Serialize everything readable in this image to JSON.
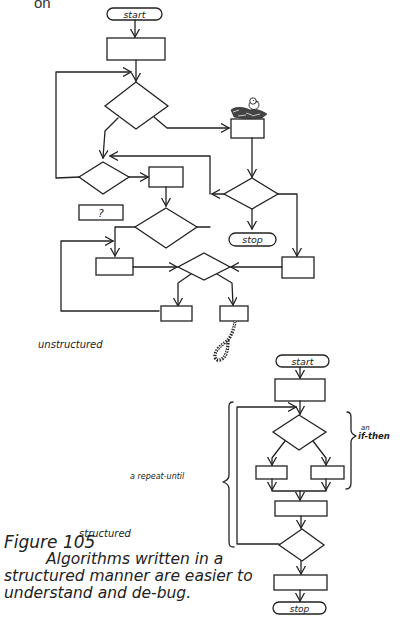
{
  "header": {
    "fragment": "on"
  },
  "unstructured": {
    "label": "unstructured",
    "start_label": "start",
    "stop_label": "stop",
    "question_box_label": "?",
    "decorations": [
      "bird-on-nest",
      "noose"
    ]
  },
  "structured": {
    "label": "structured",
    "start_label": "start",
    "stop_label": "stop",
    "if_then_prefix": "an",
    "if_then_label": "if-then",
    "repeat_until_label": "a repeat-until"
  },
  "caption": {
    "figure": "Figure 105",
    "line1": "Algorithms written in a",
    "line2": "structured manner are easier to",
    "line3": "understand and de-bug."
  },
  "colors": {
    "ink": "#222222",
    "paper": "#ffffff"
  }
}
